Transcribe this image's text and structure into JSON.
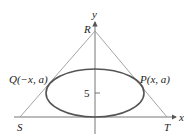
{
  "diagram": {
    "axes": {
      "x_label": "x",
      "y_label": "y"
    },
    "points": {
      "R": "R",
      "S": "S",
      "T": "T",
      "P": "P(x, a)",
      "Q": "Q(−x, a)"
    },
    "ticks": {
      "y_tick": "5"
    },
    "colors": {
      "triangle": "#9a9a9a",
      "ellipse": "#555555",
      "axes": "#555555",
      "text": "#222222"
    }
  }
}
